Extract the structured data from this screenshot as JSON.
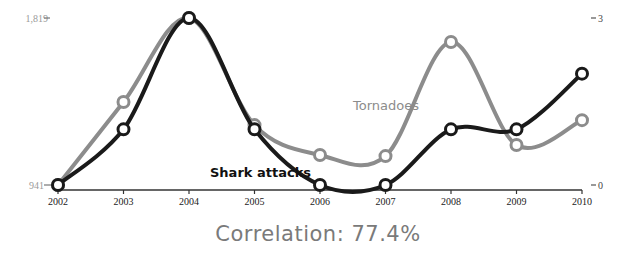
{
  "chart_data": {
    "type": "line",
    "title": "",
    "x": [
      "2002",
      "2003",
      "2004",
      "2005",
      "2006",
      "2007",
      "2008",
      "2009",
      "2010"
    ],
    "series": [
      {
        "name": "Tornadoes",
        "axis": "left",
        "color": "#8c8c8c",
        "values": [
          941,
          1377,
          1819,
          1256,
          1099,
          1093,
          1693,
          1151,
          1282
        ]
      },
      {
        "name": "Shark attacks",
        "axis": "right",
        "color": "#1a1a1a",
        "values": [
          0,
          1,
          3,
          1,
          0,
          0,
          1,
          1,
          2
        ]
      }
    ],
    "left_axis": {
      "min": 941,
      "max": 1819,
      "tick_labels": [
        "1,819",
        "941"
      ]
    },
    "right_axis": {
      "min": 0,
      "max": 3,
      "tick_labels": [
        "3",
        "0"
      ]
    },
    "xlabel": "",
    "grid": false,
    "legend": "inline labels",
    "annotation": "Correlation: 77.4%"
  },
  "labels": {
    "left_top": "1,819",
    "left_bottom": "941",
    "right_top": "3",
    "right_bottom": "0",
    "tornadoes": "Tornadoes",
    "shark_attacks": "Shark attacks",
    "correlation": "Correlation: 77.4%"
  },
  "colors": {
    "tornadoes": "#8c8c8c",
    "shark_attacks": "#1a1a1a",
    "axis": "#333333",
    "correlation_text": "#7a7a7a"
  }
}
